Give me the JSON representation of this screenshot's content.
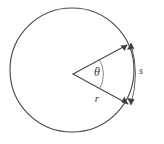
{
  "figure": {
    "kind": "geometry-diagram",
    "background_color": "#ffffff",
    "line_color": "#4a4a4a",
    "label_color": "#3a3a3a",
    "width": 164,
    "height": 144,
    "labels": {
      "angle": "θ",
      "radius": "r",
      "arc": "s"
    },
    "geometry": {
      "circle": {
        "cx": 72,
        "cy": 70,
        "r": 62
      },
      "vertex": {
        "x": 73,
        "y": 74
      },
      "radius_upper_end": {
        "x": 127,
        "y": 45
      },
      "radius_lower_end": {
        "x": 128,
        "y": 104
      },
      "angle_arc_radius": 28,
      "dimension_arc": {
        "start": {
          "x": 131,
          "y": 43
        },
        "end": {
          "x": 131,
          "y": 105
        },
        "bulge_x": 139
      },
      "label_positions": {
        "angle": {
          "x": 97,
          "y": 73
        },
        "radius": {
          "x": 97,
          "y": 99
        },
        "arc": {
          "x": 141,
          "y": 72
        }
      }
    }
  }
}
